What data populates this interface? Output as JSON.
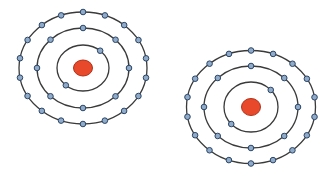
{
  "diagram": {
    "title": "",
    "colors": {
      "background": "#ffffff",
      "shell": "#3a3a3a",
      "nucleus": "#e8492b",
      "nucleus_outline": "#b0321a",
      "electron": "#8fabc9",
      "electron_outline": "#2c4566"
    },
    "atoms": [
      {
        "name": "atom-left",
        "shells": [
          {
            "name": "inner-shell",
            "electron_count": 2
          },
          {
            "name": "middle-shell",
            "electron_count": 8
          },
          {
            "name": "outer-shell",
            "electron_count": 18
          }
        ],
        "total_electrons": 28
      },
      {
        "name": "atom-right",
        "shells": [
          {
            "name": "inner-shell",
            "electron_count": 2
          },
          {
            "name": "middle-shell",
            "electron_count": 8
          },
          {
            "name": "outer-shell",
            "electron_count": 18
          }
        ],
        "total_electrons": 28
      }
    ]
  }
}
